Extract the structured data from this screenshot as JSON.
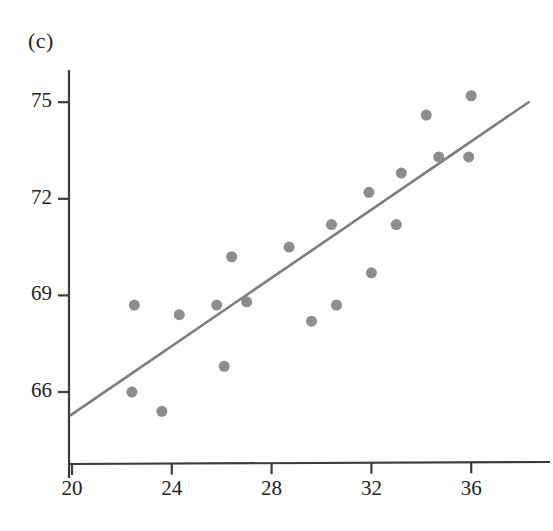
{
  "figure": {
    "panel_label": "(c)",
    "background_color": "#ffffff",
    "axis_color": "#3c3c3c",
    "point_color": "#8d8d8d",
    "line_color": "#7d7d7d"
  },
  "chart_data": {
    "type": "scatter",
    "title": "(c)",
    "xlabel": "",
    "ylabel": "",
    "xlim": [
      20,
      38.4
    ],
    "ylim": [
      64.3,
      76.2
    ],
    "grid": false,
    "legend": null,
    "xticks": [
      20,
      24,
      28,
      32,
      36
    ],
    "xtick_labels": [
      "20",
      "24",
      "28",
      "32",
      "36"
    ],
    "yticks": [
      66,
      69,
      72,
      75
    ],
    "ytick_labels": [
      "66",
      "69",
      "72",
      "75"
    ],
    "points": [
      {
        "x": 22.5,
        "y": 68.7
      },
      {
        "x": 22.4,
        "y": 66.0
      },
      {
        "x": 23.6,
        "y": 65.4
      },
      {
        "x": 24.3,
        "y": 68.4
      },
      {
        "x": 25.8,
        "y": 68.7
      },
      {
        "x": 26.1,
        "y": 66.8
      },
      {
        "x": 26.4,
        "y": 70.2
      },
      {
        "x": 27.0,
        "y": 68.8
      },
      {
        "x": 28.7,
        "y": 70.5
      },
      {
        "x": 29.6,
        "y": 68.2
      },
      {
        "x": 30.4,
        "y": 71.2
      },
      {
        "x": 30.6,
        "y": 68.7
      },
      {
        "x": 31.9,
        "y": 72.2
      },
      {
        "x": 32.0,
        "y": 69.7
      },
      {
        "x": 33.0,
        "y": 71.2
      },
      {
        "x": 33.2,
        "y": 72.8
      },
      {
        "x": 34.2,
        "y": 74.6
      },
      {
        "x": 34.7,
        "y": 73.3
      },
      {
        "x": 35.9,
        "y": 73.3
      },
      {
        "x": 36.0,
        "y": 75.2
      }
    ],
    "trend_line": {
      "type": "linear-fit",
      "x_start": 19.95,
      "y_start": 65.28,
      "x_end": 38.3,
      "y_end": 75.0
    },
    "marker_size_px": 11
  }
}
